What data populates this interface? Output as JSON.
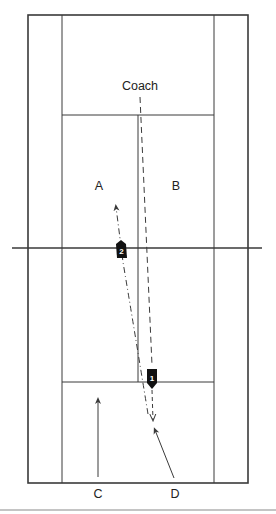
{
  "diagram": {
    "colors": {
      "line": "#3a3a3a",
      "marker": "#111111",
      "marker_text": "#ffffff",
      "separator": "#b0b0b0"
    },
    "labels": {
      "coach": "Coach",
      "a": "A",
      "b": "B",
      "c": "C",
      "d": "D"
    },
    "markers": [
      {
        "id": "1",
        "label": "1"
      },
      {
        "id": "2",
        "label": "2"
      }
    ],
    "court": {
      "outer": {
        "x1": 28,
        "y1": 15,
        "x2": 248,
        "y2": 483
      },
      "singles_left_x": 62,
      "singles_right_x": 214,
      "net_y": 248,
      "net_x1": 12,
      "net_x2": 262,
      "service_top_y": 115,
      "service_bottom_y": 382,
      "center_x": 138
    },
    "paths": [
      {
        "name": "coach-feed-path",
        "style": "dashed",
        "from": "Coach",
        "to": "marker 1"
      },
      {
        "name": "player-2-path",
        "style": "dashed",
        "from": "D region",
        "to": "A"
      },
      {
        "name": "player-c-path",
        "style": "solid",
        "from": "C",
        "to": "service line"
      },
      {
        "name": "player-d-path",
        "style": "solid",
        "from": "D",
        "to": "marker 1 region"
      }
    ]
  }
}
